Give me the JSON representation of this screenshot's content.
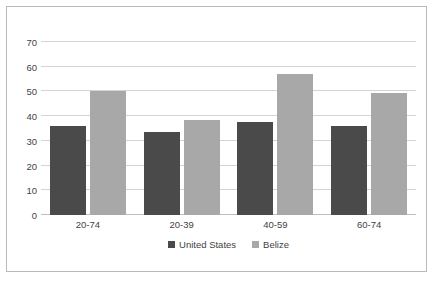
{
  "chart_data": {
    "type": "bar",
    "title": "",
    "subtitle": "",
    "xlabel": "",
    "ylabel": "",
    "categories": [
      "20-74",
      "20-39",
      "40-59",
      "60-74"
    ],
    "series": [
      {
        "name": "United States",
        "color": "#4a4a4a",
        "values": [
          36,
          33.5,
          37.5,
          36
        ]
      },
      {
        "name": "Belize",
        "color": "#a8a8a8",
        "values": [
          50,
          38.5,
          57,
          49.5
        ]
      }
    ],
    "ylim": [
      0,
      70
    ],
    "yticks": [
      0,
      10,
      20,
      30,
      40,
      50,
      60,
      70
    ],
    "ytick_labels": [
      "0",
      "10",
      "20",
      "30",
      "40",
      "50",
      "60",
      "70"
    ],
    "grid": true,
    "grid_axis": "y",
    "legend_position": "bottom-center",
    "annotations": []
  },
  "frame": {
    "border_color": "#b9b9b9",
    "background": "#ffffff"
  }
}
